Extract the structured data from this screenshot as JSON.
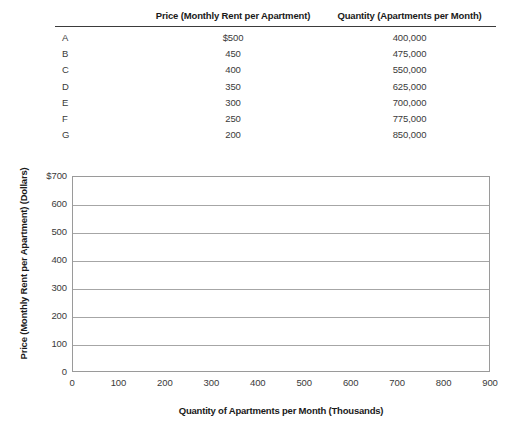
{
  "table": {
    "headers": {
      "row_label": "",
      "price": "Price (Monthly Rent per Apartment)",
      "quantity": "Quantity (Apartments per Month)"
    },
    "rows": [
      {
        "label": "A",
        "price": "$500",
        "quantity": "400,000"
      },
      {
        "label": "B",
        "price": "450",
        "quantity": "475,000"
      },
      {
        "label": "C",
        "price": "400",
        "quantity": "550,000"
      },
      {
        "label": "D",
        "price": "350",
        "quantity": "625,000"
      },
      {
        "label": "E",
        "price": "300",
        "quantity": "700,000"
      },
      {
        "label": "F",
        "price": "250",
        "quantity": "775,000"
      },
      {
        "label": "G",
        "price": "200",
        "quantity": "850,000"
      }
    ]
  },
  "chart_data": {
    "type": "line",
    "title": "",
    "xlabel": "Quantity of Apartments per Month (Thousands)",
    "ylabel": "Price (Monthly Rent per Apartment) (Dollars)",
    "xlim": [
      0,
      900
    ],
    "ylim": [
      0,
      700
    ],
    "xticks": [
      0,
      100,
      200,
      300,
      400,
      500,
      600,
      700,
      800,
      900
    ],
    "xtick_labels": [
      "0",
      "100",
      "200",
      "300",
      "400",
      "500",
      "600",
      "700",
      "800",
      "900"
    ],
    "yticks": [
      0,
      100,
      200,
      300,
      400,
      500,
      600,
      700
    ],
    "ytick_labels": [
      "0",
      "100",
      "200",
      "300",
      "400",
      "500",
      "600",
      "$700"
    ],
    "grid": "horizontal",
    "legend": "none",
    "series": [],
    "values": [],
    "categories": [],
    "annotations": [],
    "note": "empty plot grid - no data series drawn"
  },
  "colors": {
    "text": "#231f20",
    "axis_line": "#9a9a9a",
    "gridline": "#a6a6a6",
    "header_rule": "#3b3b3b",
    "background": "#ffffff"
  }
}
